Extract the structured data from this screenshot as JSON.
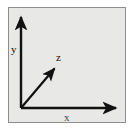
{
  "figure": {
    "background_color": "#e8e8e6",
    "border_color": "#8d8d8d",
    "stroke_color": "#111111",
    "canvas_width": 134,
    "canvas_height": 131
  },
  "axes": {
    "origin": {
      "x": 21,
      "y": 108
    },
    "items": [
      {
        "id": "y",
        "label": "y",
        "direction": "up",
        "tip": {
          "x": 21,
          "y": 14
        },
        "label_position": {
          "x": 11,
          "y": 44
        }
      },
      {
        "id": "z",
        "label": "z",
        "direction": "diagonal-up-right",
        "tip": {
          "x": 58,
          "y": 65
        },
        "label_position": {
          "x": 56,
          "y": 52
        }
      },
      {
        "id": "x",
        "label": "x",
        "direction": "right",
        "tip": {
          "x": 120,
          "y": 108
        },
        "label_position": {
          "x": 64,
          "y": 112
        }
      }
    ]
  }
}
